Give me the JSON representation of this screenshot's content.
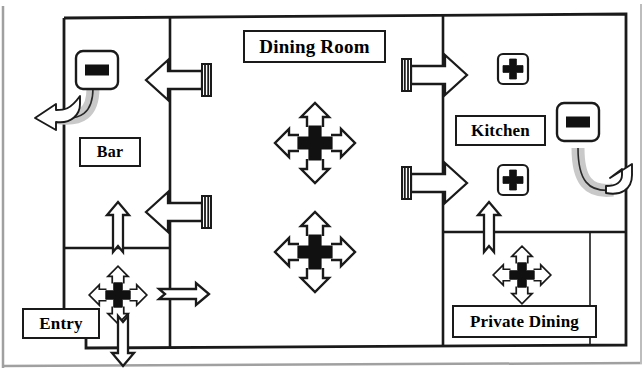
{
  "diagram": {
    "stroke_color": "#1a1a1a",
    "fill_color": "#ffffff",
    "shade_color": "#cccccc",
    "frame_color": "#9a9a9a"
  },
  "rooms": [
    {
      "id": "bar",
      "label": "Bar"
    },
    {
      "id": "dining_room",
      "label": "Dining Room"
    },
    {
      "id": "kitchen",
      "label": "Kitchen"
    },
    {
      "id": "entry",
      "label": "Entry"
    },
    {
      "id": "private_dining",
      "label": "Private Dining"
    }
  ],
  "symbols": {
    "exit_door_left": {
      "name": "exit-sign-with-egress-path",
      "direction": "left"
    },
    "exit_door_right": {
      "name": "exit-sign-with-egress-path",
      "direction": "right"
    },
    "fire_extinguisher_1": {
      "name": "fire-extinguisher-marker"
    },
    "fire_extinguisher_2": {
      "name": "fire-extinguisher-marker"
    },
    "assembly_dining_1": {
      "name": "four-way-evacuation-marker"
    },
    "assembly_dining_2": {
      "name": "four-way-evacuation-marker"
    },
    "assembly_entry": {
      "name": "four-way-evacuation-marker"
    },
    "assembly_private": {
      "name": "four-way-evacuation-marker"
    },
    "door_bar_upper": {
      "name": "door-swing-arrow",
      "direction": "left"
    },
    "door_bar_lower": {
      "name": "door-swing-arrow",
      "direction": "left"
    },
    "door_kitchen_upper": {
      "name": "door-swing-arrow",
      "direction": "right"
    },
    "door_kitchen_lower": {
      "name": "door-swing-arrow",
      "direction": "right"
    },
    "flow_entry_up": {
      "name": "egress-flow-arrow",
      "direction": "up"
    },
    "flow_entry_down": {
      "name": "egress-flow-arrow",
      "direction": "down"
    },
    "flow_entry_right": {
      "name": "egress-flow-arrow",
      "direction": "right"
    },
    "flow_private_up": {
      "name": "egress-flow-arrow",
      "direction": "up"
    }
  }
}
